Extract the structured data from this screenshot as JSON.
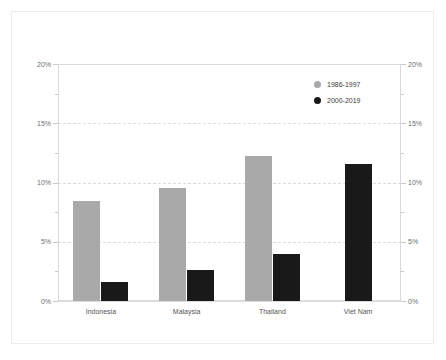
{
  "chart_data": {
    "type": "bar",
    "title": "",
    "subtitle": "",
    "xlabel": "",
    "ylabel": "",
    "categories": [
      "Indonesia",
      "Malaysia",
      "Thailand",
      "Viet Nam"
    ],
    "series": [
      {
        "name": "1986-1997",
        "color": "#a9a9a9",
        "marker": "circle",
        "values": [
          8.4,
          9.5,
          12.2,
          null
        ]
      },
      {
        "name": "2000-2019",
        "color": "#191919",
        "marker": "circle",
        "values": [
          1.6,
          2.6,
          4.0,
          11.6
        ]
      }
    ],
    "ylim": [
      0,
      20
    ],
    "ytick_values": [
      0,
      5,
      10,
      15,
      20
    ],
    "ytick_labels": [
      "0%",
      "5%",
      "10%",
      "15%",
      "20%"
    ],
    "yminor_tick_values": [
      2.5,
      7.5,
      12.5,
      17.5
    ],
    "value_suffix": "%",
    "grid": true,
    "grid_axis": "y",
    "grid_style": "dashed",
    "dual_y_axis": true,
    "right_ytick_labels": [
      "0%",
      "5%",
      "10%",
      "15%",
      "20%"
    ],
    "legend_position": "top-right-inside",
    "background_color": "#ffffff",
    "frame_color": "#ececec",
    "axis_color": "#d9d9d9",
    "grid_color": "#dcdcdc",
    "tick_label_color": "#6e6e6e",
    "category_label_color": "#555555"
  }
}
